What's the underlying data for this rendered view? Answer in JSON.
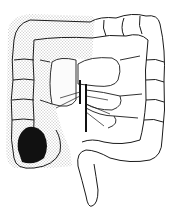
{
  "figure": {
    "regions": [
      {
        "name": "ascending-colon",
        "fill": "stippled"
      },
      {
        "name": "cecum-lesion",
        "fill": "solid-dark"
      },
      {
        "name": "transverse-colon",
        "fill": "outline"
      },
      {
        "name": "descending-colon",
        "fill": "outline"
      },
      {
        "name": "sigmoid-colon",
        "fill": "outline"
      },
      {
        "name": "mesenteric-vessels",
        "fill": "lines"
      }
    ],
    "colors": {
      "background": "#ffffff",
      "line": "#1a1a1a",
      "stipple": "#555555",
      "lesion": "#111111"
    }
  }
}
